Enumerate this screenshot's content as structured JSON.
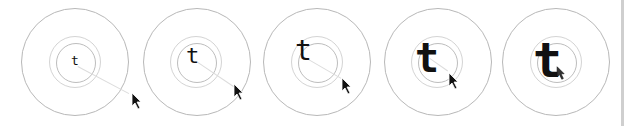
{
  "figure": {
    "glyph": "t",
    "colors": {
      "outer_circle": "#b8b8b8",
      "inner_ring": "#bdbdbd",
      "halo_ring": "#d4d4d4",
      "glyph": "#111111",
      "trail": "#dcdcdc",
      "edge_bar": "#cfcfcf"
    },
    "panels": [
      {
        "id": 1,
        "glyph": "t",
        "center": [
          75,
          62
        ],
        "outer_r": 54,
        "ring_r": 26,
        "inner_r": 20,
        "glyph_pos": [
          71,
          54
        ],
        "glyph_size": 13,
        "cursor": [
          131,
          92
        ]
      },
      {
        "id": 2,
        "glyph": "t",
        "center": [
          196,
          62
        ],
        "outer_r": 54,
        "ring_r": 26,
        "inner_r": 20,
        "glyph_pos": [
          186,
          45
        ],
        "glyph_size": 22,
        "cursor": [
          233,
          83
        ]
      },
      {
        "id": 3,
        "glyph": "t",
        "center": [
          317,
          62
        ],
        "outer_r": 54,
        "ring_r": 26,
        "inner_r": 20,
        "glyph_pos": [
          295,
          37
        ],
        "glyph_size": 28,
        "cursor": [
          341,
          77
        ]
      },
      {
        "id": 4,
        "glyph": "t",
        "center": [
          438,
          62
        ],
        "outer_r": 54,
        "ring_r": 26,
        "inner_r": 20,
        "glyph_pos": [
          415,
          38
        ],
        "glyph_size": 40,
        "cursor": [
          448,
          72
        ]
      },
      {
        "id": 5,
        "glyph": "t",
        "center": [
          556,
          62
        ],
        "outer_r": 54,
        "ring_r": 26,
        "inner_r": 20,
        "glyph_pos": [
          533,
          36
        ],
        "glyph_size": 48,
        "cursor": [
          560,
          68
        ]
      }
    ]
  }
}
